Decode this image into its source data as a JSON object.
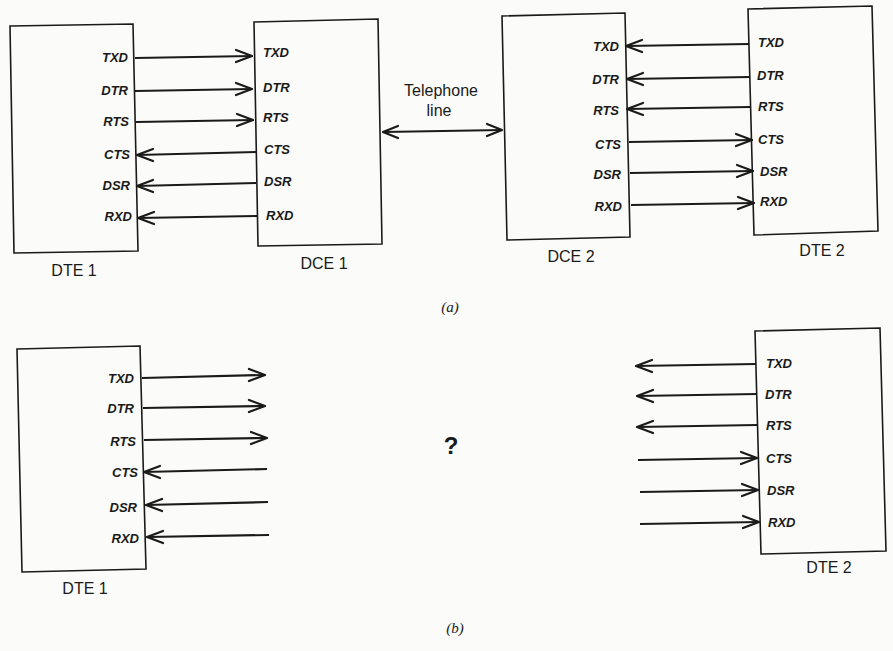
{
  "part_a": {
    "label": "(a)",
    "dte1": {
      "caption": "DTE 1",
      "signals": [
        {
          "name": "TXD",
          "dir": "out"
        },
        {
          "name": "DTR",
          "dir": "out"
        },
        {
          "name": "RTS",
          "dir": "out"
        },
        {
          "name": "CTS",
          "dir": "in"
        },
        {
          "name": "DSR",
          "dir": "in"
        },
        {
          "name": "RXD",
          "dir": "in"
        }
      ]
    },
    "dce1": {
      "caption": "DCE 1",
      "signals": [
        "TXD",
        "DTR",
        "RTS",
        "CTS",
        "DSR",
        "RXD"
      ]
    },
    "telephone_line": {
      "line1": "Telephone",
      "line2": "line",
      "direction": "bidirectional"
    },
    "dce2": {
      "caption": "DCE 2",
      "signals": [
        "TXD",
        "DTR",
        "RTS",
        "CTS",
        "DSR",
        "RXD"
      ]
    },
    "dte2": {
      "caption": "DTE 2",
      "signals": [
        {
          "name": "TXD",
          "dir": "out"
        },
        {
          "name": "DTR",
          "dir": "out"
        },
        {
          "name": "RTS",
          "dir": "out"
        },
        {
          "name": "CTS",
          "dir": "in"
        },
        {
          "name": "DSR",
          "dir": "in"
        },
        {
          "name": "RXD",
          "dir": "in"
        }
      ]
    }
  },
  "part_b": {
    "label": "(b)",
    "question_mark": "?",
    "dte1": {
      "caption": "DTE 1",
      "signals": [
        {
          "name": "TXD",
          "dir": "out"
        },
        {
          "name": "DTR",
          "dir": "out"
        },
        {
          "name": "RTS",
          "dir": "out"
        },
        {
          "name": "CTS",
          "dir": "in"
        },
        {
          "name": "DSR",
          "dir": "in"
        },
        {
          "name": "RXD",
          "dir": "in"
        }
      ]
    },
    "dte2": {
      "caption": "DTE 2",
      "signals": [
        {
          "name": "TXD",
          "dir": "out"
        },
        {
          "name": "DTR",
          "dir": "out"
        },
        {
          "name": "RTS",
          "dir": "out"
        },
        {
          "name": "CTS",
          "dir": "in"
        },
        {
          "name": "DSR",
          "dir": "in"
        },
        {
          "name": "RXD",
          "dir": "in"
        }
      ]
    }
  },
  "colors": {
    "ink": "#1a1a1a",
    "paper": "#fbfbf9"
  }
}
